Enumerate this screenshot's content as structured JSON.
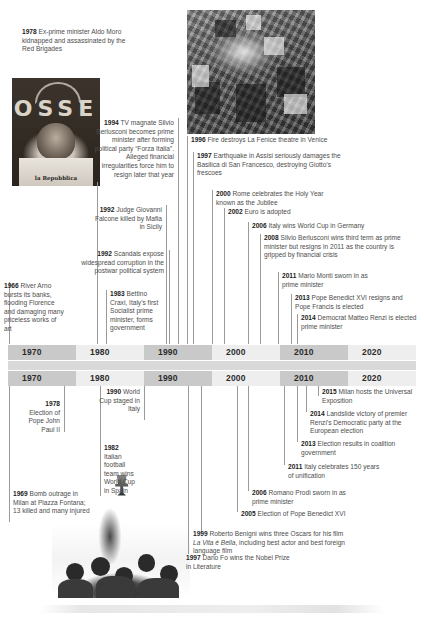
{
  "meta": {
    "width": 424,
    "height": 621,
    "accent": "#1c1c1c",
    "axis_dark": "#c9c9c9",
    "axis_light": "#eeeeee",
    "line_color": "#9a9a9a",
    "text_color": "#4d4d4d"
  },
  "axes": {
    "top": {
      "name": "upper-timeline-axis",
      "ticks": [
        "1970",
        "1980",
        "1990",
        "2000",
        "2010",
        "2020"
      ]
    },
    "bottom": {
      "name": "lower-timeline-axis",
      "ticks": [
        "1970",
        "1980",
        "1990",
        "2000",
        "2010",
        "2020"
      ]
    }
  },
  "photos": [
    {
      "id": "photo-moro",
      "name": "photo-aldo-moro-newspaper",
      "caption_year": "1978",
      "masthead": "la Repubblica",
      "banner_text": "OSSE",
      "alt": "Black and white photograph of Aldo Moro held by the Red Brigades in front of a Brigate Rosse banner, wearing a shirt with la Repubblica newspaper"
    },
    {
      "id": "photo-fenice",
      "name": "photo-la-fenice-fire",
      "caption_year": "1996",
      "alt": "Aerial black and white photograph of smoke rising from the burnt La Fenice theatre among Venice rooftops"
    },
    {
      "id": "photo-football",
      "name": "photo-1982-world-cup-celebration",
      "caption_year": "1982",
      "alt": "Black and white photograph of Italian football fans celebrating, lifting a World Cup trophy"
    }
  ],
  "events_upper": [
    {
      "id": "ev-1978-moro",
      "name": "event-1978-aldo-moro",
      "year": "1978",
      "text": "Ex-prime minister Aldo Moro kidnapped and assassinated by the Red Brigades",
      "align": "left"
    },
    {
      "id": "ev-1994-berlusconi",
      "name": "event-1994-berlusconi",
      "year": "1994",
      "text": "TV magnate Silvio Berlusconi becomes prime minister after forming political party “Forza Italia”. Alleged financial irregularities force him to resign later that year",
      "align": "right"
    },
    {
      "id": "ev-1996-fenice",
      "name": "event-1996-la-fenice",
      "year": "1996",
      "text": "Fire destroys La Fenice theatre in Venice",
      "align": "left"
    },
    {
      "id": "ev-1997-assisi",
      "name": "event-1997-assisi-earthquake",
      "year": "1997",
      "text": "Earthquake in Assisi seriously damages the Basilica di San Francesco, destroying Giotto’s frescoes",
      "align": "left"
    },
    {
      "id": "ev-2000-jubilee",
      "name": "event-2000-jubilee",
      "year": "2000",
      "text": "Rome celebrates the Holy Year known as the Jubilee",
      "align": "left"
    },
    {
      "id": "ev-2002-euro",
      "name": "event-2002-euro",
      "year": "2002",
      "text": "Euro is adopted",
      "align": "left"
    },
    {
      "id": "ev-2006-worldcup",
      "name": "event-2006-world-cup",
      "year": "2006",
      "text": "Italy wins World Cup in Germany",
      "align": "left"
    },
    {
      "id": "ev-2008-berlusconi",
      "name": "event-2008-berlusconi-third-term",
      "year": "2008",
      "text": "Silvio Berlusconi wins third term as prime minister but resigns in 2011 as the country is gripped by financial crisis",
      "align": "left"
    },
    {
      "id": "ev-2011-monti",
      "name": "event-2011-mario-monti",
      "year": "2011",
      "text": "Mario Monti sworn in as prime minister",
      "align": "left"
    },
    {
      "id": "ev-2013-pope",
      "name": "event-2013-pope-francis",
      "year": "2013",
      "text": "Pope Benedict XVI resigns and Pope Francis is elected",
      "align": "left"
    },
    {
      "id": "ev-2014-renzi",
      "name": "event-2014-matteo-renzi",
      "year": "2014",
      "text": "Democrat Matteo Renzi is elected prime minister",
      "align": "left"
    },
    {
      "id": "ev-1992-falcone",
      "name": "event-1992-giovanni-falcone",
      "year": "1992",
      "text": "Judge Giovanni Falcone killed by Mafia in Sicily",
      "align": "right"
    },
    {
      "id": "ev-1992-scandals",
      "name": "event-1992-corruption-scandals",
      "year": "1992",
      "text": "Scandals expose widespread corruption in the postwar political system",
      "align": "right"
    },
    {
      "id": "ev-1983-craxi",
      "name": "event-1983-bettino-craxi",
      "year": "1983",
      "text": "Bettino Craxi, Italy’s first Socialist prime minister, forms government",
      "align": "left"
    },
    {
      "id": "ev-1966-arno",
      "name": "event-1966-arno-flood",
      "year": "1966",
      "text": "River Arno bursts its banks, flooding Florence and damaging many priceless works of art",
      "align": "left"
    }
  ],
  "events_lower": [
    {
      "id": "ev-1990-worldcup",
      "name": "event-1990-world-cup-italy",
      "year": "1990",
      "text": "World Cup staged in Italy",
      "align": "right"
    },
    {
      "id": "ev-1978-pope",
      "name": "event-1978-pope-john-paul-ii",
      "year": "1978",
      "text": "Election of Pope John Paul II",
      "align": "right"
    },
    {
      "id": "ev-1982-football",
      "name": "event-1982-world-cup-spain",
      "year": "1982",
      "text": "Italian football team wins World Cup in Spain",
      "align": "left"
    },
    {
      "id": "ev-1969-piazza-fontana",
      "name": "event-1969-piazza-fontana-bombing",
      "year": "1969",
      "text": "Bomb outrage in Milan at Piazza Fontana; 13 killed and many injured",
      "align": "left"
    },
    {
      "id": "ev-2015-expo",
      "name": "event-2015-milan-expo",
      "year": "2015",
      "text": "Milan hosts the Universal Exposition",
      "align": "left"
    },
    {
      "id": "ev-2014-renzi-european",
      "name": "event-2014-european-election",
      "year": "2014",
      "text": "Landslide victory of premier Renzi’s Democratic party at the European election",
      "align": "left"
    },
    {
      "id": "ev-2013-coalition",
      "name": "event-2013-coalition-government",
      "year": "2013",
      "text": "Election results in coalition government",
      "align": "left"
    },
    {
      "id": "ev-2011-unification",
      "name": "event-2011-unification-anniversary",
      "year": "2011",
      "text": "Italy celebrates 150 years of unification",
      "align": "left"
    },
    {
      "id": "ev-2006-prodi",
      "name": "event-2006-romano-prodi",
      "year": "2006",
      "text": "Romano Prodi sworn in as prime minister",
      "align": "left"
    },
    {
      "id": "ev-2005-benedict",
      "name": "event-2005-pope-benedict-xvi",
      "year": "2005",
      "text": "Election of Pope Benedict XVI",
      "align": "left"
    },
    {
      "id": "ev-1999-benigni",
      "name": "event-1999-roberto-benigni-oscars",
      "year": "1999",
      "text_pre": "Roberto Benigni wins three Oscars for his film ",
      "text_italic": "La Vita è Bella",
      "text_post": ", including best actor and best foreign language film",
      "align": "left"
    },
    {
      "id": "ev-1997-dario-fo",
      "name": "event-1997-dario-fo-nobel",
      "year": "1997",
      "text": "Dario Fo wins the Nobel Prize in Literature",
      "align": "left"
    }
  ]
}
